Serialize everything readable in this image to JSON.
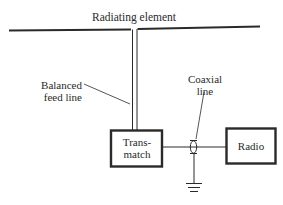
{
  "diagram": {
    "labels": {
      "radiating_element": "Radiating element",
      "balanced_feed_line_1": "Balanced",
      "balanced_feed_line_2": "feed line",
      "coaxial_line_1": "Coaxial",
      "coaxial_line_2": "line",
      "transmatch_1": "Trans-",
      "transmatch_2": "match",
      "radio": "Radio"
    },
    "components": [
      "radiating-element",
      "balanced-feed-line",
      "transmatch",
      "coaxial-line",
      "ground",
      "radio"
    ],
    "colors": {
      "line": "#2a2a2a",
      "background": "#ffffff"
    }
  }
}
